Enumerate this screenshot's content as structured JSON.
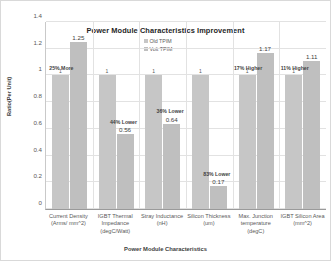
{
  "chart_data": {
    "type": "bar",
    "title": "Power Module Characteristics Improvement",
    "xlabel": "Power Module Characteristics",
    "ylabel": "Ratio(Per Unit)",
    "ylim": [
      0,
      1.4
    ],
    "yticks": [
      "0",
      "0.2",
      "0.4",
      "0.6",
      "0.8",
      "1",
      "1.2",
      "1.4"
    ],
    "grid": true,
    "legend_position": "top-center",
    "categories": [
      "Current Density\n(Arms/ mm^2)",
      "IGBT Thermal\nImpedance\n(degC/Watt)",
      "Stray Inductance\n(nH)",
      "Silicon Thickness\n(um)",
      "Max. Junction\ntemperature\n(degC)",
      "IGBT Silicon Area\n(mm^2)"
    ],
    "category_lines": [
      [
        "Current Density",
        "(Arms/ mm^2)"
      ],
      [
        "IGBT Thermal",
        "Impedance",
        "(degC/Watt)"
      ],
      [
        "Stray Inductance",
        "(nH)"
      ],
      [
        "Silicon Thickness",
        "(um)"
      ],
      [
        "Max. Junction",
        "temperature",
        "(degC)"
      ],
      [
        "IGBT Silicon Area",
        "(mm^2)"
      ]
    ],
    "series": [
      {
        "name": "Old TPIM",
        "color": "#c6c6c6",
        "values": [
          1,
          1,
          1,
          1,
          1,
          1
        ],
        "labels": [
          "1",
          "1",
          "1",
          "1",
          "1",
          "1"
        ]
      },
      {
        "name": "Volt TPIM",
        "color": "#bfbfbf",
        "values": [
          1.25,
          0.56,
          0.64,
          0.17,
          1.17,
          1.11
        ],
        "labels": [
          "1.25",
          "0.56",
          "0.64",
          "0.17",
          "1.17",
          "1.11"
        ]
      }
    ],
    "annotations": [
      "25% More",
      "44% Lower",
      "36% Lower",
      "83% Lower",
      "17% Higher",
      "11% Higher"
    ]
  }
}
